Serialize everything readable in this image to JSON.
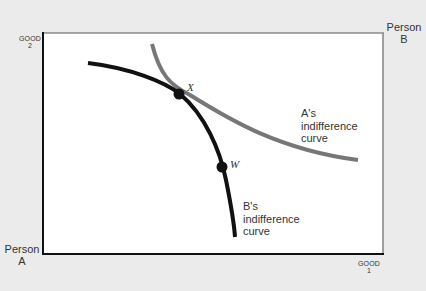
{
  "diagram": {
    "type": "edgeworth-box",
    "colors": {
      "background": "#ebebeb",
      "box_fill": "#ffffff",
      "box_border_origin_a": "#111111",
      "box_border_origin_b": "#8a8a8a",
      "curve_b": "#111111",
      "curve_a": "#777777",
      "points": "#111111"
    },
    "axes": {
      "good2": {
        "line1": "GOOD",
        "line2": "2"
      },
      "good1": {
        "line1": "GOOD",
        "line2": "1"
      }
    },
    "origins": {
      "person_a": {
        "line1": "Person",
        "line2": "A"
      },
      "person_b": {
        "line1": "Person",
        "line2": "B"
      }
    },
    "curves": {
      "a": {
        "line1": "A's",
        "line2": "indifference",
        "line3": "curve"
      },
      "b": {
        "line1": "B's",
        "line2": "indifference",
        "line3": "curve"
      }
    },
    "points": {
      "x": {
        "label": "X"
      },
      "w": {
        "label": "W"
      }
    }
  }
}
